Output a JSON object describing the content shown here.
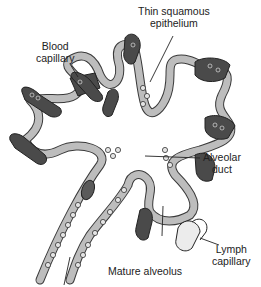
{
  "diagram": {
    "type": "anatomical-illustration",
    "labels": [
      {
        "id": "blood_capillary",
        "line1": "Blood",
        "line2": "capillary"
      },
      {
        "id": "thin_squamous_epithelium",
        "line1": "Thin squamous",
        "line2": "epithelium"
      },
      {
        "id": "alveolar_duct",
        "line1": "Alveolar",
        "line2": "duct"
      },
      {
        "id": "mature_alveolus",
        "line1": "Mature alveolus"
      },
      {
        "id": "lymph_capillary",
        "line1": "Lymph",
        "line2": "capillary"
      }
    ],
    "colors": {
      "wall": "#b8b8b8",
      "wall_outline": "#3a3a3a",
      "capillary": "#4a4a4a",
      "lymph": "#e8e8e8",
      "background": "#ffffff"
    }
  }
}
